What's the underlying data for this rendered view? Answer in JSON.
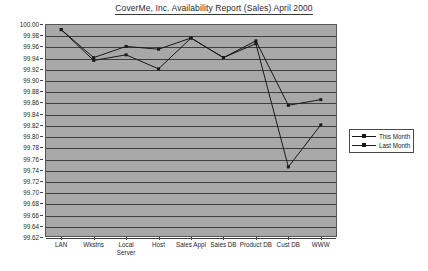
{
  "chart_data": {
    "type": "line",
    "title": "CoverMe, Inc. Availability Report (Sales) April 2000",
    "xlabel": "",
    "ylabel": "",
    "ylim": [
      99.62,
      100.0
    ],
    "ytick_step": 0.02,
    "grid": true,
    "legend_position": "right",
    "categories": [
      "LAN",
      "Wkstns",
      "Local Server",
      "Host",
      "Sales Appl",
      "Sales DB",
      "Product DB",
      "Cust DB",
      "WWW"
    ],
    "ytick_labels": [
      "100.00",
      "99.98",
      "99.96",
      "99.94",
      "99.92",
      "99.90",
      "99.88",
      "99.86",
      "99.84",
      "99.82",
      "99.80",
      "99.78",
      "99.76",
      "99.74",
      "99.72",
      "99.70",
      "99.68",
      "99.66",
      "99.64",
      "99.62"
    ],
    "series": [
      {
        "name": "This Month",
        "color": "#1a1a1a",
        "values": [
          99.99,
          99.94,
          99.96,
          99.955,
          99.975,
          99.94,
          99.97,
          99.855,
          99.865
        ]
      },
      {
        "name": "Last Month",
        "color": "#1a1a1a",
        "values": [
          99.99,
          99.935,
          99.945,
          99.92,
          99.975,
          99.94,
          99.965,
          99.745,
          99.82
        ]
      }
    ]
  },
  "legend": {
    "items": [
      {
        "label": "This Month"
      },
      {
        "label": "Last Month"
      }
    ]
  },
  "colors": {
    "plot_background": "#a8a8a8",
    "gridline": "#3f3f3f",
    "series_line": "#1a1a1a",
    "text": "#1f1f1f"
  }
}
